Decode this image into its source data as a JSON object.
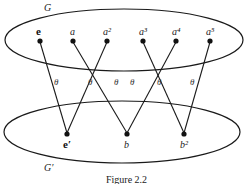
{
  "diagram": {
    "top_set": {
      "label": "G",
      "nodes": [
        {
          "id": "e",
          "label": "e",
          "bold": true,
          "x": 40,
          "y": 41
        },
        {
          "id": "a",
          "label": "a",
          "x": 73,
          "y": 41
        },
        {
          "id": "a2",
          "label": "a²",
          "x": 107,
          "y": 41
        },
        {
          "id": "a3",
          "label": "a³",
          "x": 143,
          "y": 41
        },
        {
          "id": "a4",
          "label": "a⁴",
          "x": 176,
          "y": 41
        },
        {
          "id": "a5",
          "label": "a⁵",
          "x": 210,
          "y": 41
        }
      ]
    },
    "bottom_set": {
      "label": "G′",
      "nodes": [
        {
          "id": "e_prime",
          "label": "e′",
          "bold": true,
          "x": 67,
          "y": 134
        },
        {
          "id": "b",
          "label": "b",
          "x": 127,
          "y": 134
        },
        {
          "id": "b2",
          "label": "b²",
          "x": 184,
          "y": 134
        }
      ]
    },
    "map_label": "θ",
    "edges": [
      {
        "from": "e",
        "to": "e_prime"
      },
      {
        "from": "a",
        "to": "b"
      },
      {
        "from": "a2",
        "to": "e_prime"
      },
      {
        "from": "a3",
        "to": "b2"
      },
      {
        "from": "a4",
        "to": "b"
      },
      {
        "from": "a5",
        "to": "b2"
      }
    ],
    "caption": "Figure 2.2"
  }
}
